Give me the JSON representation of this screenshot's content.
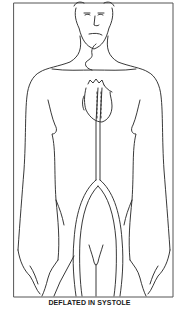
{
  "figure": {
    "caption": "DEFLATED IN SYSTOLE",
    "labels_visible": []
  },
  "colors": {
    "background": "#ffffff",
    "line": "#222222",
    "frame": "#555555"
  }
}
